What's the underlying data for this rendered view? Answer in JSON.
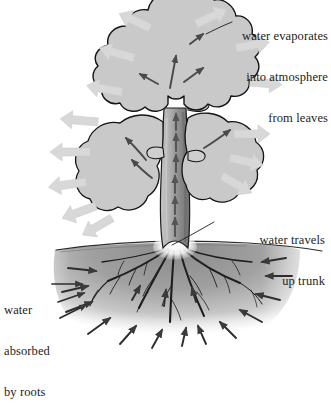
{
  "diagram": {
    "type": "botanical-process-diagram",
    "palette": {
      "background": "#ffffff",
      "leaf_fill": "#c9c9c9",
      "leaf_outline": "#1a1a1a",
      "trunk_fill": "#b4b4b4",
      "trunk_shadow": "#7d7d7d",
      "soil_fill": "#9b9b9b",
      "evaporation_arrow": "#d6d6d6",
      "flow_arrow": "#3a3a3a",
      "text": "#1d1d1d"
    },
    "labels": {
      "evaporation": {
        "line1": "water evaporates",
        "line2": "into atmosphere",
        "line3": "from leaves",
        "align": "right",
        "leader": "line-to-canopy"
      },
      "trunk": {
        "line1": "water travels",
        "line2": "up trunk",
        "align": "right",
        "leader": "line-to-trunk-base"
      },
      "roots": {
        "line1": "water",
        "line2": "absorbed",
        "line3": "by roots",
        "align": "left",
        "leader": "arrows-into-soil"
      }
    },
    "parts": {
      "canopy": "upper lobed leaf mass",
      "mid_leaves": "two broad lobed leaves flanking trunk",
      "trunk": "shaded vertical trunk with upward arrows",
      "root_crown": "white flare where trunk meets ground",
      "roots": "branching dark roots spreading in soil",
      "ground_line": "horizon line across image",
      "soil": "gray soil mass fading outward"
    },
    "flows": {
      "evaporation_arrows": 12,
      "trunk_arrows": 6,
      "leaf_arrows": 7,
      "soil_arrows": 16,
      "evaporation_direction": "outward from foliage",
      "trunk_direction": "upward",
      "soil_direction": "inward and upward toward roots"
    }
  }
}
